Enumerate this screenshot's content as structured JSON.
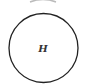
{
  "diagram": {
    "type": "node",
    "nodes": [
      {
        "id": "H",
        "label": "H",
        "shape": "circle"
      }
    ],
    "partial_nodes_cut_off": [
      {
        "position": "top",
        "visible": "bottom edge of circle arc"
      }
    ],
    "colors": {
      "stroke": "#222222",
      "label": "#333333",
      "background": "#ffffff",
      "faded_arc": "#bbbbbb"
    }
  }
}
